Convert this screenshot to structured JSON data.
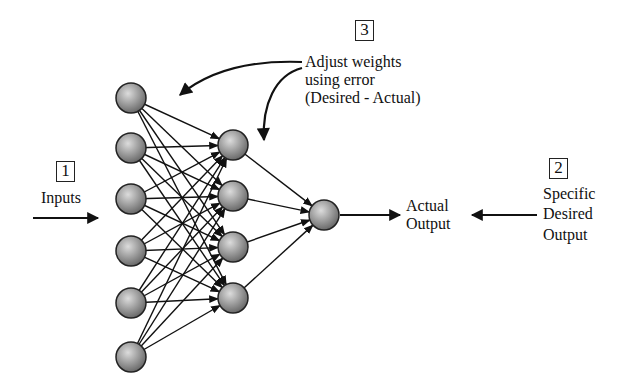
{
  "diagram": {
    "steps": [
      {
        "number": "1",
        "label": "Inputs"
      },
      {
        "number": "2",
        "label_lines": [
          "Specific",
          "Desired",
          "Output"
        ]
      },
      {
        "number": "3",
        "label_lines": [
          "Adjust weights",
          "using error",
          "(Desired - Actual)"
        ]
      }
    ],
    "output_label_lines": [
      "Actual",
      "Output"
    ],
    "layers": {
      "input_nodes": 6,
      "hidden_nodes": 4,
      "output_nodes": 1
    },
    "colors": {
      "line": "#111111",
      "node_light": "#d8d8d8",
      "node_dark": "#6a6a6a"
    }
  }
}
